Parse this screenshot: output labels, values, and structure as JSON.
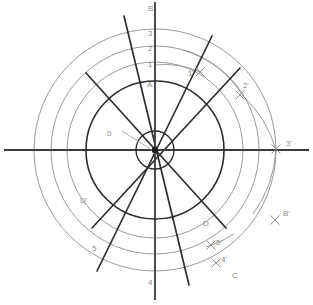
{
  "figure": {
    "background": "#ffffff",
    "size": {
      "width": 313,
      "height": 305
    },
    "center": {
      "x": 155,
      "y": 150
    }
  },
  "colors": {
    "axis": "#3a3a3a",
    "dark_circle": "#2b2b2b",
    "gray_circle": "#9a9a9a",
    "radial_line": "#2e2e2e",
    "label_gray": "#8b8b8b",
    "label_dark": "#6e6e6e",
    "leader": "#a8a8a8",
    "marker": "#8f8f8f"
  },
  "circles": [
    {
      "name": "inner-hub-circle",
      "radius": 19,
      "stroke": "#2b2b2b",
      "width": 1.3
    },
    {
      "name": "main-dark-circle",
      "radius": 69,
      "stroke": "#2b2b2b",
      "width": 1.6
    },
    {
      "name": "gray-circle-1",
      "radius": 88,
      "stroke": "#9a9a9a",
      "width": 1.0
    },
    {
      "name": "gray-circle-2",
      "radius": 104,
      "stroke": "#9a9a9a",
      "width": 1.0
    },
    {
      "name": "gray-circle-3",
      "radius": 121,
      "stroke": "#9a9a9a",
      "width": 1.0
    }
  ],
  "axes": [
    {
      "name": "vertical-axis",
      "x1": 155,
      "y1": 2,
      "x2": 155,
      "y2": 300
    },
    {
      "name": "horizontal-axis",
      "x1": 4,
      "y1": 150,
      "x2": 309,
      "y2": 150
    }
  ],
  "radial_lines": [
    {
      "name": "radial-line-a",
      "x1": 86,
      "y1": 73,
      "x2": 226,
      "y2": 228
    },
    {
      "name": "radial-line-b",
      "x1": 92,
      "y1": 228,
      "x2": 240,
      "y2": 68
    },
    {
      "name": "radial-line-c",
      "x1": 124,
      "y1": 16,
      "x2": 189,
      "y2": 285
    },
    {
      "name": "radial-line-d",
      "x1": 97,
      "y1": 271,
      "x2": 212,
      "y2": 36
    },
    {
      "name": "radial-line-e",
      "x1": 36,
      "y1": 150,
      "x2": 287,
      "y2": 150
    }
  ],
  "arc_markers": [
    {
      "name": "marker-1-prime",
      "x": 200,
      "y": 72
    },
    {
      "name": "marker-2-prime",
      "x": 240,
      "y": 95
    },
    {
      "name": "marker-3-prime",
      "x": 276,
      "y": 149
    },
    {
      "name": "marker-b-prime",
      "x": 275,
      "y": 220
    },
    {
      "name": "marker-5-prime",
      "x": 211,
      "y": 245
    },
    {
      "name": "marker-4-prime",
      "x": 216,
      "y": 263
    }
  ],
  "construction_arcs": [
    {
      "name": "arc-from-1-to-1-prime",
      "rx": 85,
      "ry": 85,
      "x1": 155,
      "y1": 65,
      "x2": 202,
      "y2": 73,
      "sweep": 1
    },
    {
      "name": "arc-from-2-to-2-prime",
      "rx": 104,
      "ry": 104,
      "x1": 183,
      "y1": 50,
      "x2": 243,
      "y2": 96,
      "sweep": 1
    },
    {
      "name": "arc-from-3-to-3-prime",
      "rx": 121,
      "ry": 121,
      "x1": 243,
      "y1": 96,
      "x2": 276,
      "y2": 150,
      "sweep": 1
    },
    {
      "name": "arc-b-to-b-prime",
      "rx": 121,
      "ry": 121,
      "x1": 276,
      "y1": 150,
      "x2": 253,
      "y2": 214,
      "sweep": 1
    },
    {
      "name": "arc-c-to-5-prime",
      "rx": 104,
      "ry": 104,
      "x1": 234,
      "y1": 234,
      "x2": 206,
      "y2": 247,
      "sweep": 1
    }
  ],
  "leader_line": {
    "name": "origin-leader-line",
    "x1": 122,
    "y1": 131,
    "x2": 152,
    "y2": 150
  },
  "labels": [
    {
      "name": "label-b-top",
      "text": "B",
      "x": 148,
      "y": 11,
      "style": "gray"
    },
    {
      "name": "label-3-top",
      "text": "3",
      "x": 148,
      "y": 36,
      "style": "gray"
    },
    {
      "name": "label-2-top",
      "text": "2",
      "x": 148,
      "y": 51,
      "style": "gray"
    },
    {
      "name": "label-1-top",
      "text": "1",
      "x": 148,
      "y": 67,
      "style": "gray"
    },
    {
      "name": "label-a-top",
      "text": "A",
      "x": 147,
      "y": 87,
      "style": "gray"
    },
    {
      "name": "label-1-prime",
      "text": "1'",
      "x": 188,
      "y": 76,
      "style": "gray"
    },
    {
      "name": "label-2-prime",
      "text": "2'",
      "x": 243,
      "y": 88,
      "style": "gray"
    },
    {
      "name": "label-3-prime",
      "text": "3'",
      "x": 286,
      "y": 146,
      "style": "gray"
    },
    {
      "name": "label-b-prime",
      "text": "B'",
      "x": 283,
      "y": 216,
      "style": "gray"
    },
    {
      "name": "label-d-right",
      "text": "D",
      "x": 203,
      "y": 226,
      "style": "gray"
    },
    {
      "name": "label-5-prime",
      "text": "5'",
      "x": 216,
      "y": 245,
      "style": "gray"
    },
    {
      "name": "label-4-prime",
      "text": "4'",
      "x": 221,
      "y": 262,
      "style": "gray"
    },
    {
      "name": "label-c-bottom",
      "text": "C",
      "x": 232,
      "y": 278,
      "style": "gray"
    },
    {
      "name": "label-4-bottom",
      "text": "4",
      "x": 148,
      "y": 285,
      "style": "gray"
    },
    {
      "name": "label-5-left",
      "text": "5",
      "x": 92,
      "y": 251,
      "style": "gray"
    },
    {
      "name": "label-d-prime",
      "text": "D'",
      "x": 80,
      "y": 203,
      "style": "gray"
    },
    {
      "name": "label-0-origin",
      "text": "0",
      "x": 107,
      "y": 136,
      "style": "gray"
    }
  ]
}
